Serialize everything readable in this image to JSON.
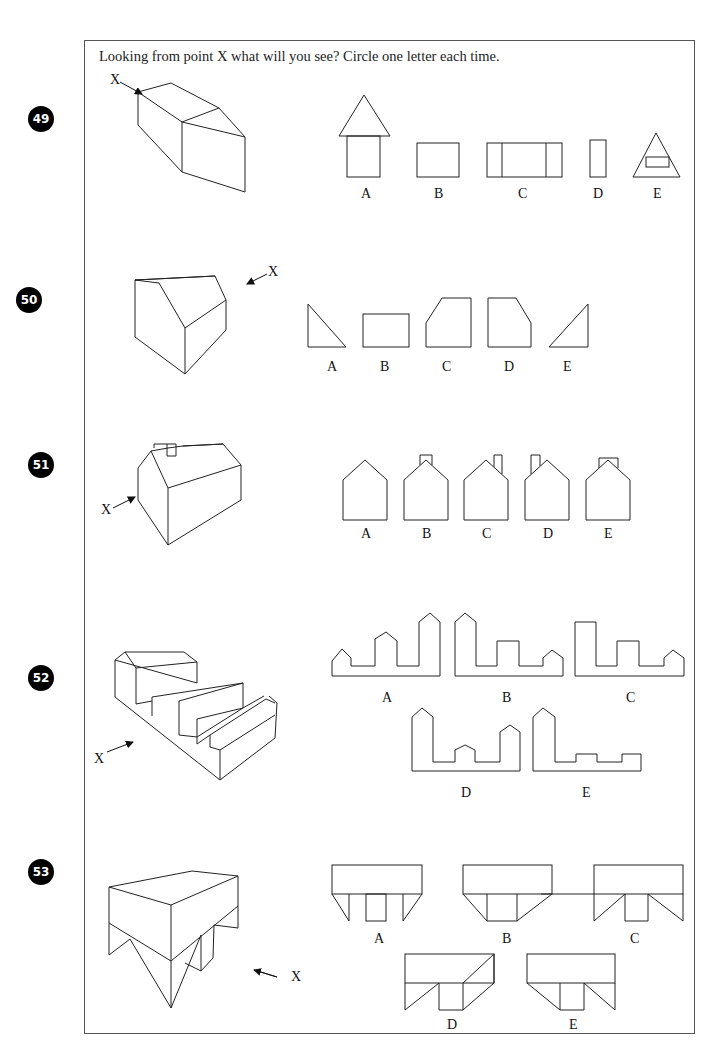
{
  "instruction": "Looking from point X what will you see? Circle one letter each time.",
  "viewpoint_label": "X",
  "questions": [
    {
      "number": "49",
      "options": [
        "A",
        "B",
        "C",
        "D",
        "E"
      ]
    },
    {
      "number": "50",
      "options": [
        "A",
        "B",
        "C",
        "D",
        "E"
      ]
    },
    {
      "number": "51",
      "options": [
        "A",
        "B",
        "C",
        "D",
        "E"
      ]
    },
    {
      "number": "52",
      "options": [
        "A",
        "B",
        "C",
        "D",
        "E"
      ]
    },
    {
      "number": "53",
      "options": [
        "A",
        "B",
        "C",
        "D",
        "E"
      ]
    }
  ]
}
